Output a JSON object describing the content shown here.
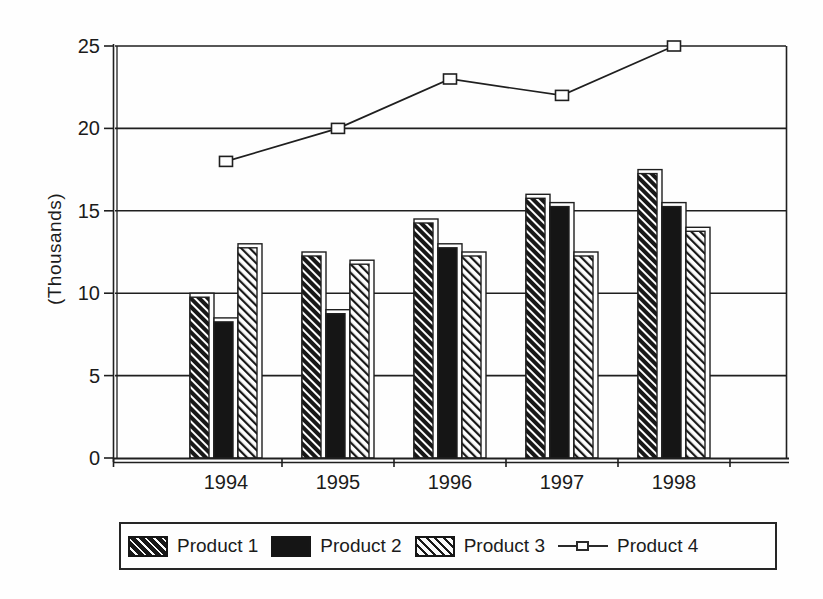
{
  "colors": {
    "ink": "#1f1f1f",
    "fill_dark": "#151515",
    "background": "#fefefe"
  },
  "chart_data": {
    "type": "bar+line",
    "categories": [
      "1994",
      "1995",
      "1996",
      "1997",
      "1998"
    ],
    "series": [
      {
        "name": "Product 1",
        "type": "bar",
        "pattern": "dense-diagonal-hatch",
        "values": [
          10,
          12.5,
          14.5,
          16,
          17.5
        ]
      },
      {
        "name": "Product 2",
        "type": "bar",
        "pattern": "solid-black",
        "values": [
          8.5,
          9,
          13,
          15.5,
          15.5
        ]
      },
      {
        "name": "Product 3",
        "type": "bar",
        "pattern": "light-diagonal-hatch",
        "values": [
          13,
          12,
          12.5,
          12.5,
          14
        ]
      },
      {
        "name": "Product 4",
        "type": "line",
        "marker": "open-square",
        "values": [
          18,
          20,
          23,
          22,
          25
        ]
      }
    ],
    "title": "",
    "xlabel": "",
    "ylabel": "(Thousands)",
    "ylim": [
      0,
      25
    ],
    "yticks": [
      0,
      5,
      10,
      15,
      20,
      25
    ],
    "grid": true,
    "legend_position": "bottom"
  }
}
